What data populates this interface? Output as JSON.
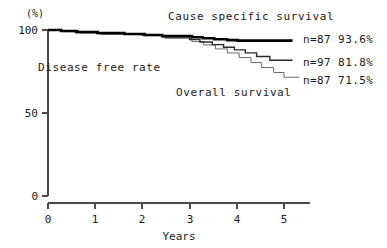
{
  "chart_data": {
    "type": "line",
    "title": "",
    "xlabel": "Years",
    "ylabel": "(%)",
    "xlim": [
      0,
      5.35
    ],
    "ylim": [
      0,
      105
    ],
    "grid": false,
    "legend_position": "right-inline",
    "x_ticks": [
      "0",
      "1",
      "2",
      "3",
      "4",
      "5"
    ],
    "x_tick_values": [
      0,
      1,
      2,
      3,
      4,
      5
    ],
    "y_ticks": [
      "0",
      "50",
      "100"
    ],
    "y_tick_values": [
      0,
      50,
      100
    ],
    "annotations": [
      {
        "id": "cause-specific-label",
        "text": "Cause specific survival"
      },
      {
        "id": "disease-free-label",
        "text": "Disease free rate"
      },
      {
        "id": "overall-label",
        "text": "Overall survival"
      }
    ],
    "series": [
      {
        "name": "Cause specific survival",
        "n": "n=87",
        "final_percent": "93.6%",
        "legend_text": "n=87 93.6%",
        "color": "#000000",
        "style": "thick",
        "steps": [
          [
            0.0,
            100.0
          ],
          [
            0.28,
            100.0
          ],
          [
            0.28,
            99.4
          ],
          [
            0.62,
            99.4
          ],
          [
            0.62,
            98.8
          ],
          [
            1.05,
            98.8
          ],
          [
            1.05,
            98.2
          ],
          [
            1.62,
            98.2
          ],
          [
            1.62,
            97.6
          ],
          [
            2.05,
            97.6
          ],
          [
            2.05,
            97.0
          ],
          [
            2.42,
            97.0
          ],
          [
            2.42,
            96.4
          ],
          [
            3.05,
            96.4
          ],
          [
            3.05,
            95.6
          ],
          [
            3.28,
            95.6
          ],
          [
            3.28,
            95.0
          ],
          [
            3.52,
            95.0
          ],
          [
            3.52,
            94.4
          ],
          [
            3.8,
            94.4
          ],
          [
            3.8,
            93.9
          ],
          [
            4.02,
            93.9
          ],
          [
            4.02,
            93.6
          ],
          [
            5.18,
            93.6
          ]
        ]
      },
      {
        "name": "Disease free rate",
        "n": "n=97",
        "final_percent": "81.8%",
        "legend_text": "n=97 81.8%",
        "color": "#2b2b2b",
        "style": "medium",
        "steps": [
          [
            0.0,
            100.0
          ],
          [
            0.28,
            100.0
          ],
          [
            0.28,
            99.2
          ],
          [
            0.58,
            99.2
          ],
          [
            0.58,
            98.4
          ],
          [
            1.05,
            98.4
          ],
          [
            1.05,
            97.8
          ],
          [
            1.95,
            97.8
          ],
          [
            1.95,
            97.2
          ],
          [
            2.42,
            97.2
          ],
          [
            2.42,
            95.8
          ],
          [
            3.0,
            95.8
          ],
          [
            3.0,
            94.2
          ],
          [
            3.22,
            94.2
          ],
          [
            3.22,
            92.8
          ],
          [
            3.48,
            92.8
          ],
          [
            3.48,
            91.2
          ],
          [
            3.72,
            91.2
          ],
          [
            3.72,
            89.6
          ],
          [
            3.95,
            89.6
          ],
          [
            3.95,
            88.0
          ],
          [
            4.18,
            88.0
          ],
          [
            4.18,
            86.2
          ],
          [
            4.42,
            86.2
          ],
          [
            4.42,
            84.0
          ],
          [
            4.7,
            84.0
          ],
          [
            4.7,
            81.8
          ],
          [
            5.18,
            81.8
          ]
        ]
      },
      {
        "name": "Overall survival",
        "n": "n=87",
        "final_percent": "71.5%",
        "legend_text": "n=87 71.5%",
        "color": "#6b6b6b",
        "style": "thin",
        "steps": [
          [
            0.0,
            100.0
          ],
          [
            0.3,
            100.0
          ],
          [
            0.3,
            99.0
          ],
          [
            0.68,
            99.0
          ],
          [
            0.68,
            98.2
          ],
          [
            1.12,
            98.2
          ],
          [
            1.12,
            97.4
          ],
          [
            2.0,
            97.4
          ],
          [
            2.0,
            96.6
          ],
          [
            2.48,
            96.6
          ],
          [
            2.48,
            95.0
          ],
          [
            3.05,
            95.0
          ],
          [
            3.05,
            93.0
          ],
          [
            3.3,
            93.0
          ],
          [
            3.3,
            91.0
          ],
          [
            3.55,
            91.0
          ],
          [
            3.55,
            88.6
          ],
          [
            3.8,
            88.6
          ],
          [
            3.8,
            86.2
          ],
          [
            4.05,
            86.2
          ],
          [
            4.05,
            83.4
          ],
          [
            4.3,
            83.4
          ],
          [
            4.3,
            80.4
          ],
          [
            4.52,
            80.4
          ],
          [
            4.52,
            77.4
          ],
          [
            4.78,
            77.4
          ],
          [
            4.78,
            74.4
          ],
          [
            5.0,
            74.4
          ],
          [
            5.0,
            71.5
          ],
          [
            5.32,
            71.5
          ]
        ]
      }
    ]
  }
}
